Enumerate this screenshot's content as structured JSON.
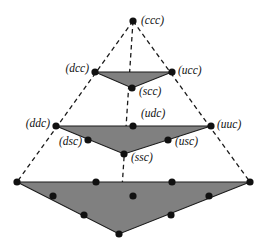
{
  "figure": {
    "name": "nested-simplex-lattice",
    "background_color": "#ffffff",
    "fill_color": "#808080",
    "edge_color": "#1a1a1a",
    "dash_color": "#1a1a1a",
    "node_color": "#111111",
    "node_radius": 3.6,
    "width": 266,
    "height": 248
  },
  "labels": {
    "ccc": "(ccc)",
    "dcc": "(dcc)",
    "ucc": "(ucc)",
    "scc": "(scc)",
    "ddc": "(ddc)",
    "udc": "(udc)",
    "uuc": "(uuc)",
    "dsc": "(dsc)",
    "usc": "(usc)",
    "ssc": "(ssc)"
  },
  "nodes": {
    "ccc": {
      "x": 133,
      "y": 21,
      "label": "(ccc)",
      "label_x": 141,
      "label_y": 21,
      "anchor": "start"
    },
    "dcc": {
      "x": 95,
      "y": 72,
      "label": "(dcc)",
      "label_x": 89,
      "label_y": 69,
      "anchor": "end"
    },
    "ucc": {
      "x": 172,
      "y": 72,
      "label": "(ucc)",
      "label_x": 178,
      "label_y": 71,
      "anchor": "start"
    },
    "scc": {
      "x": 132,
      "y": 88,
      "label": "(scc)",
      "label_x": 139,
      "label_y": 92,
      "anchor": "start"
    },
    "ddc": {
      "x": 56,
      "y": 126,
      "label": "(ddc)",
      "label_x": 50,
      "label_y": 124,
      "anchor": "end"
    },
    "udc": {
      "x": 133,
      "y": 126,
      "label": "(udc)",
      "label_x": 141,
      "label_y": 114,
      "anchor": "start"
    },
    "uuc": {
      "x": 211,
      "y": 126,
      "label": "(uuc)",
      "label_x": 217,
      "label_y": 125,
      "anchor": "start"
    },
    "dsc": {
      "x": 88,
      "y": 140,
      "label": "(dsc)",
      "label_x": 82,
      "label_y": 142,
      "anchor": "end"
    },
    "usc": {
      "x": 168,
      "y": 140,
      "label": "(usc)",
      "label_x": 175,
      "label_y": 142,
      "anchor": "start"
    },
    "ssc": {
      "x": 124,
      "y": 154,
      "label": "(ssc)",
      "label_x": 131,
      "label_y": 158,
      "anchor": "start"
    }
  },
  "triangles": [
    {
      "name": "top-triangle",
      "points": "95,72 172,72 132,88",
      "vertices": [
        "dcc",
        "ucc",
        "scc"
      ]
    },
    {
      "name": "middle-triangle",
      "points": "56,126 211,126 124,154",
      "vertices": [
        "ddc",
        "uuc",
        "ssc"
      ]
    },
    {
      "name": "bottom-triangle",
      "points": "17,182 250,182 119,234",
      "vertices": [
        "bottom-left",
        "bottom-right",
        "bottom-apex"
      ]
    }
  ],
  "dashed_lines": [
    {
      "name": "left-edge",
      "x1": 133,
      "y1": 21,
      "x2": 17,
      "y2": 182
    },
    {
      "name": "right-edge",
      "x1": 133,
      "y1": 21,
      "x2": 250,
      "y2": 182
    },
    {
      "name": "center-axis",
      "x1": 133,
      "y1": 21,
      "x2": 119,
      "y2": 234
    }
  ],
  "bottom_nodes": [
    {
      "name": "bottom-row1-p1",
      "x": 17,
      "y": 182
    },
    {
      "name": "bottom-row1-p2",
      "x": 96,
      "y": 182
    },
    {
      "name": "bottom-row1-p3",
      "x": 172,
      "y": 182
    },
    {
      "name": "bottom-row1-p4",
      "x": 250,
      "y": 182
    },
    {
      "name": "bottom-row2-p1",
      "x": 53,
      "y": 196
    },
    {
      "name": "bottom-row2-p2",
      "x": 133,
      "y": 196
    },
    {
      "name": "bottom-row2-p3",
      "x": 209,
      "y": 196
    },
    {
      "name": "bottom-row3-p1",
      "x": 84,
      "y": 215
    },
    {
      "name": "bottom-row3-p2",
      "x": 171,
      "y": 215
    },
    {
      "name": "bottom-apex",
      "x": 119,
      "y": 234
    }
  ]
}
